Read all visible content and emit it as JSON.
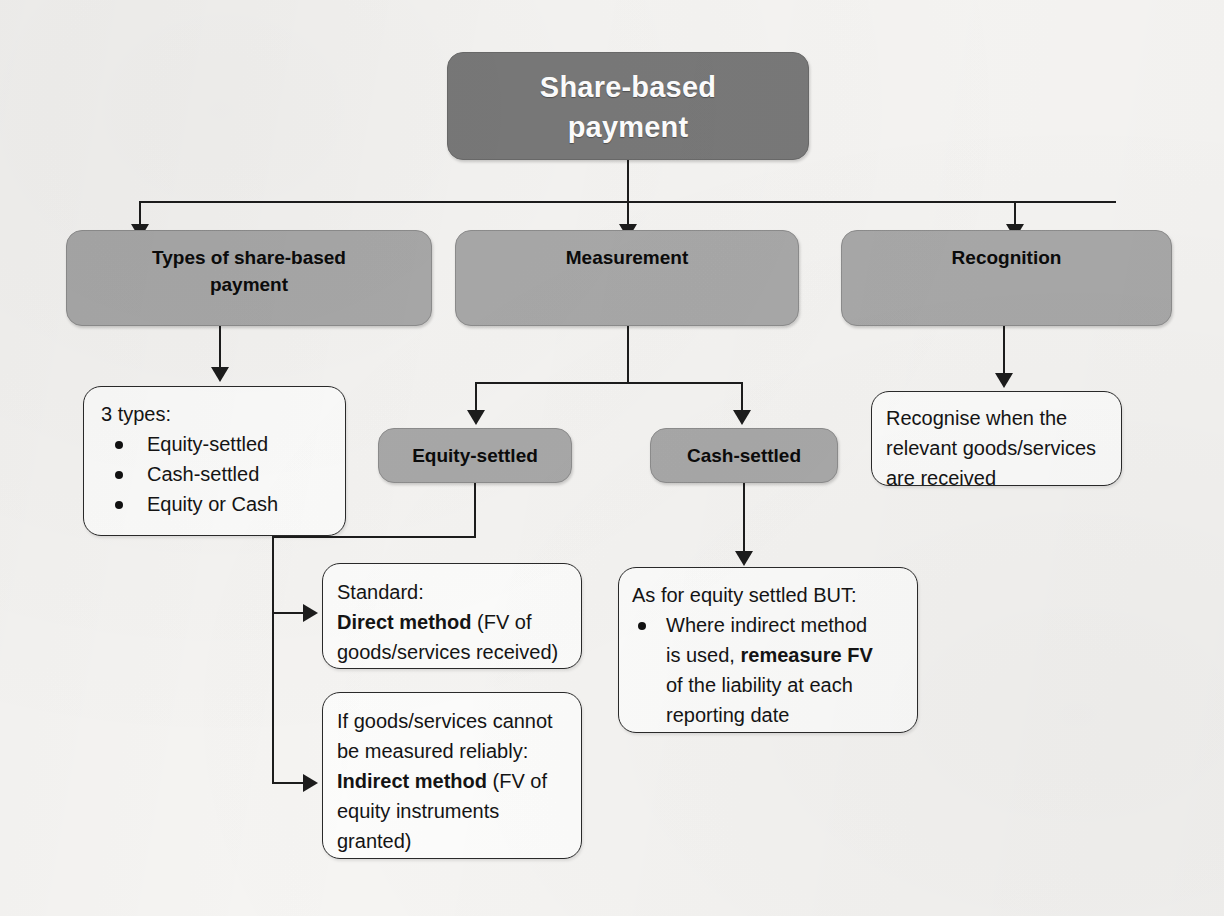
{
  "diagram": {
    "title_node": {
      "label": "Share-based\npayment",
      "line1": "Share-based",
      "line2": "payment"
    },
    "level2": [
      {
        "id": "types",
        "line1": "Types of share-based",
        "line2": "payment"
      },
      {
        "id": "measurement",
        "line1": "Measurement",
        "line2": ""
      },
      {
        "id": "recognition",
        "line1": "Recognition",
        "line2": ""
      }
    ],
    "level3": [
      {
        "id": "equity-settled",
        "label": "Equity-settled"
      },
      {
        "id": "cash-settled",
        "label": "Cash-settled"
      }
    ],
    "types_box": {
      "heading": "3 types:",
      "bullets": [
        "Equity-settled",
        "Cash-settled",
        "Equity or Cash"
      ]
    },
    "recognition_box": {
      "line1": "Recognise when the",
      "line2": "relevant goods/services",
      "line3": "are received"
    },
    "direct_method_box": {
      "line1": "Standard:",
      "bold": "Direct method",
      "after_bold": " (FV of",
      "line3": "goods/services received)"
    },
    "indirect_method_box": {
      "line1": "If goods/services cannot",
      "line2": "be measured reliably:",
      "bold": "Indirect method",
      "after_bold": " (FV of",
      "line4": "equity instruments",
      "line5": "granted)"
    },
    "cash_settled_box": {
      "heading": "As for equity settled BUT:",
      "bullet_part1": "Where indirect method",
      "bullet_part2_pre": "is used, ",
      "bullet_part2_bold": "remeasure FV",
      "bullet_part3": "of the liability at each",
      "bullet_part4": "reporting date"
    },
    "colors": {
      "dark_node": "#797979",
      "shaded_node": "#a9a9a9",
      "outline_node": "#fdfdfc",
      "connector": "#1c1c1c",
      "page_background": "#f6f5f3",
      "title_text": "#ffffff",
      "body_text": "#141414"
    }
  }
}
